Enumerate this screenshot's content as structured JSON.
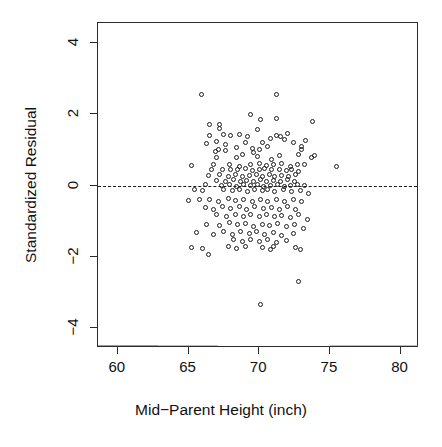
{
  "chart_data": {
    "type": "scatter",
    "title": "",
    "xlabel": "Mid-Parent Height (inch)",
    "ylabel": "Standardized Residual",
    "xlim": [
      58.6,
      81.3
    ],
    "ylim": [
      -4.55,
      4.55
    ],
    "xticks": [
      60,
      65,
      70,
      75,
      80
    ],
    "yticks": [
      4,
      2,
      0,
      -2,
      -4
    ],
    "xtick_labels": [
      "60",
      "65",
      "70",
      "75",
      "80"
    ],
    "ytick_labels": [
      "4",
      "2",
      "0",
      "-2",
      "-4"
    ],
    "grid": false,
    "legend": null,
    "point_symbol": "open-circle",
    "point_color": "#1c1c1c",
    "reference_lines": [
      {
        "name": "zero-residual-line",
        "orientation": "horizontal",
        "y": 0,
        "style": "dashed",
        "color": "#1a1a1a"
      }
    ],
    "n_points": 205,
    "points": [
      [
        65.9,
        2.55
      ],
      [
        71.2,
        2.55
      ],
      [
        69.4,
        1.98
      ],
      [
        70.1,
        1.86
      ],
      [
        71.2,
        1.88
      ],
      [
        73.8,
        1.79
      ],
      [
        66.5,
        1.7
      ],
      [
        67.2,
        1.72
      ],
      [
        67.2,
        1.6
      ],
      [
        69.9,
        1.56
      ],
      [
        66.5,
        1.4
      ],
      [
        67.5,
        1.44
      ],
      [
        68.0,
        1.4
      ],
      [
        68.6,
        1.42
      ],
      [
        69.2,
        1.36
      ],
      [
        71.2,
        1.4
      ],
      [
        71.5,
        1.38
      ],
      [
        72.0,
        1.45
      ],
      [
        70.8,
        1.32
      ],
      [
        71.8,
        1.3
      ],
      [
        66.3,
        1.18
      ],
      [
        67.0,
        1.22
      ],
      [
        67.6,
        1.14
      ],
      [
        69.0,
        1.2
      ],
      [
        70.2,
        1.2
      ],
      [
        72.4,
        1.2
      ],
      [
        73.3,
        1.26
      ],
      [
        73.0,
        1.1
      ],
      [
        73.0,
        1.02
      ],
      [
        67.1,
        1.0
      ],
      [
        67.6,
        0.98
      ],
      [
        68.4,
        1.06
      ],
      [
        69.5,
        1.04
      ],
      [
        70.0,
        1.0
      ],
      [
        70.6,
        1.08
      ],
      [
        66.9,
        0.94
      ],
      [
        68.8,
        0.88
      ],
      [
        69.6,
        0.92
      ],
      [
        67.0,
        0.78
      ],
      [
        68.4,
        0.78
      ],
      [
        69.9,
        0.8
      ],
      [
        70.9,
        0.74
      ],
      [
        71.4,
        0.84
      ],
      [
        72.8,
        0.86
      ],
      [
        73.9,
        0.84
      ],
      [
        73.7,
        0.78
      ],
      [
        65.2,
        0.56
      ],
      [
        66.8,
        0.6
      ],
      [
        67.9,
        0.58
      ],
      [
        68.6,
        0.54
      ],
      [
        69.4,
        0.58
      ],
      [
        70.0,
        0.62
      ],
      [
        70.5,
        0.56
      ],
      [
        71.0,
        0.6
      ],
      [
        71.6,
        0.62
      ],
      [
        72.2,
        0.54
      ],
      [
        72.7,
        0.58
      ],
      [
        73.2,
        0.6
      ],
      [
        75.5,
        0.52
      ],
      [
        66.6,
        0.44
      ],
      [
        67.4,
        0.44
      ],
      [
        68.0,
        0.46
      ],
      [
        68.5,
        0.44
      ],
      [
        69.0,
        0.48
      ],
      [
        69.5,
        0.42
      ],
      [
        70.0,
        0.44
      ],
      [
        70.4,
        0.48
      ],
      [
        70.9,
        0.44
      ],
      [
        71.4,
        0.46
      ],
      [
        71.9,
        0.42
      ],
      [
        72.3,
        0.46
      ],
      [
        72.8,
        0.4
      ],
      [
        66.4,
        0.28
      ],
      [
        67.2,
        0.3
      ],
      [
        67.8,
        0.26
      ],
      [
        68.3,
        0.3
      ],
      [
        68.8,
        0.24
      ],
      [
        69.3,
        0.28
      ],
      [
        69.8,
        0.3
      ],
      [
        70.2,
        0.26
      ],
      [
        70.7,
        0.3
      ],
      [
        71.1,
        0.24
      ],
      [
        71.6,
        0.28
      ],
      [
        72.1,
        0.26
      ],
      [
        72.6,
        0.3
      ],
      [
        67.0,
        0.14
      ],
      [
        67.6,
        0.12
      ],
      [
        68.2,
        0.16
      ],
      [
        68.7,
        0.1
      ],
      [
        69.1,
        0.14
      ],
      [
        69.6,
        0.12
      ],
      [
        70.1,
        0.16
      ],
      [
        70.5,
        0.1
      ],
      [
        71.0,
        0.14
      ],
      [
        71.5,
        0.12
      ],
      [
        72.0,
        0.16
      ],
      [
        72.5,
        0.1
      ],
      [
        66.2,
        0.02
      ],
      [
        67.3,
        0.0
      ],
      [
        67.9,
        0.04
      ],
      [
        68.4,
        -0.02
      ],
      [
        68.9,
        0.02
      ],
      [
        69.4,
        0.0
      ],
      [
        69.9,
        0.04
      ],
      [
        70.3,
        -0.02
      ],
      [
        70.8,
        0.0
      ],
      [
        71.3,
        0.02
      ],
      [
        71.8,
        -0.02
      ],
      [
        72.2,
        0.0
      ],
      [
        72.7,
        0.02
      ],
      [
        73.2,
        0.0
      ],
      [
        65.4,
        -0.12
      ],
      [
        66.0,
        -0.14
      ],
      [
        67.5,
        -0.1
      ],
      [
        68.1,
        -0.14
      ],
      [
        68.6,
        -0.1
      ],
      [
        69.2,
        -0.16
      ],
      [
        69.7,
        -0.12
      ],
      [
        70.2,
        -0.14
      ],
      [
        70.6,
        -0.1
      ],
      [
        71.1,
        -0.16
      ],
      [
        71.7,
        -0.12
      ],
      [
        72.3,
        -0.18
      ],
      [
        72.9,
        -0.14
      ],
      [
        73.5,
        -0.22
      ],
      [
        65.0,
        -0.42
      ],
      [
        65.8,
        -0.38
      ],
      [
        66.5,
        -0.4
      ],
      [
        67.1,
        -0.44
      ],
      [
        67.8,
        -0.36
      ],
      [
        68.3,
        -0.42
      ],
      [
        68.9,
        -0.38
      ],
      [
        69.5,
        -0.44
      ],
      [
        70.1,
        -0.4
      ],
      [
        70.6,
        -0.46
      ],
      [
        71.2,
        -0.38
      ],
      [
        71.8,
        -0.44
      ],
      [
        72.4,
        -0.4
      ],
      [
        73.0,
        -0.46
      ],
      [
        66.2,
        -0.62
      ],
      [
        66.8,
        -0.66
      ],
      [
        67.4,
        -0.6
      ],
      [
        68.0,
        -0.64
      ],
      [
        68.6,
        -0.58
      ],
      [
        69.1,
        -0.66
      ],
      [
        69.7,
        -0.6
      ],
      [
        70.3,
        -0.64
      ],
      [
        70.9,
        -0.62
      ],
      [
        71.4,
        -0.68
      ],
      [
        72.0,
        -0.6
      ],
      [
        72.6,
        -0.66
      ],
      [
        67.0,
        -0.82
      ],
      [
        67.7,
        -0.86
      ],
      [
        68.3,
        -0.8
      ],
      [
        68.9,
        -0.88
      ],
      [
        69.4,
        -0.82
      ],
      [
        70.0,
        -0.86
      ],
      [
        70.5,
        -0.8
      ],
      [
        71.1,
        -0.88
      ],
      [
        71.6,
        -0.84
      ],
      [
        72.2,
        -0.9
      ],
      [
        72.8,
        -0.82
      ],
      [
        73.4,
        -0.96
      ],
      [
        66.3,
        -1.08
      ],
      [
        67.2,
        -1.12
      ],
      [
        67.9,
        -1.04
      ],
      [
        68.5,
        -1.1
      ],
      [
        69.0,
        -1.06
      ],
      [
        69.6,
        -1.14
      ],
      [
        70.2,
        -1.08
      ],
      [
        70.7,
        -1.12
      ],
      [
        71.3,
        -1.06
      ],
      [
        71.9,
        -1.16
      ],
      [
        72.5,
        -1.1
      ],
      [
        73.1,
        -1.2
      ],
      [
        65.6,
        -1.32
      ],
      [
        66.8,
        -1.38
      ],
      [
        67.5,
        -1.3
      ],
      [
        68.1,
        -1.36
      ],
      [
        68.7,
        -1.28
      ],
      [
        69.3,
        -1.34
      ],
      [
        69.8,
        -1.3
      ],
      [
        70.4,
        -1.38
      ],
      [
        71.0,
        -1.32
      ],
      [
        71.6,
        -1.4
      ],
      [
        72.4,
        -1.34
      ],
      [
        68.2,
        -1.52
      ],
      [
        68.8,
        -1.58
      ],
      [
        69.4,
        -1.5
      ],
      [
        70.0,
        -1.56
      ],
      [
        70.6,
        -1.52
      ],
      [
        71.2,
        -1.6
      ],
      [
        71.9,
        -1.54
      ],
      [
        65.2,
        -1.74
      ],
      [
        66.0,
        -1.76
      ],
      [
        67.8,
        -1.7
      ],
      [
        68.4,
        -1.76
      ],
      [
        69.0,
        -1.72
      ],
      [
        70.2,
        -1.74
      ],
      [
        70.8,
        -1.78
      ],
      [
        71.0,
        -1.72
      ],
      [
        72.6,
        -1.74
      ],
      [
        72.9,
        -1.78
      ],
      [
        66.4,
        -1.92
      ],
      [
        72.8,
        -2.68
      ],
      [
        70.1,
        -3.34
      ]
    ]
  },
  "axis_titles": {
    "x": "Mid-Parent Height (inch)",
    "y": "Standardized Residual"
  }
}
